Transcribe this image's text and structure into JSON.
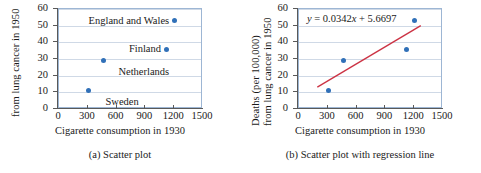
{
  "figure": {
    "panels": [
      {
        "caption": "(a)  Scatter plot",
        "ytitle_lines": [
          "from lung cancer in 1950"
        ],
        "xtitle": "Cigarette consumption in 1930",
        "equation": null,
        "show_labels": true,
        "show_regression": false
      },
      {
        "caption": "(b)  Scatter plot with regression line",
        "ytitle_lines": [
          "Deaths (per 100,000)",
          "from lung cancer in 1950"
        ],
        "xtitle": "Cigarette consumption in 1930",
        "equation_prefix": "y",
        "equation_rest": " = 0.0342",
        "equation_var": "x",
        "equation_tail": " + 5.6697",
        "show_labels": false,
        "show_regression": true
      }
    ]
  },
  "chart_data": {
    "type": "scatter",
    "title": "",
    "xlabel": "Cigarette consumption in 1930",
    "ylabel": "Deaths (per 100,000) from lung cancer in 1950",
    "xlim": [
      0,
      1500
    ],
    "ylim": [
      0,
      60
    ],
    "xticks": [
      0,
      300,
      600,
      900,
      1200,
      1500
    ],
    "yticks": [
      0,
      10,
      20,
      30,
      40,
      50,
      60
    ],
    "grid": "horizontal",
    "legend": "none",
    "marker_color": "#3070b8",
    "line_color": "#cc3344",
    "points": [
      {
        "label": "Sweden",
        "x": 310,
        "y": 11
      },
      {
        "label": "Netherlands",
        "x": 460,
        "y": 29
      },
      {
        "label": "Finland",
        "x": 1115,
        "y": 36
      },
      {
        "label": "England and Wales",
        "x": 1200,
        "y": 53
      }
    ],
    "regression": {
      "slope": 0.0342,
      "intercept": 5.6697,
      "equation": "y = 0.0342x + 5.6697",
      "x_start": 190,
      "x_end": 1290
    }
  }
}
